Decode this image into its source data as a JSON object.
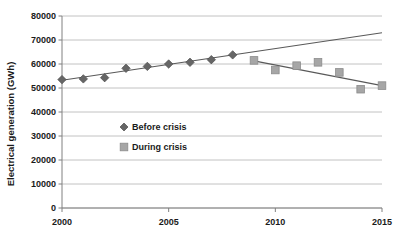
{
  "chart_data": {
    "type": "scatter",
    "title": "",
    "xlabel": "",
    "ylabel": "Electrical generation (GWh)",
    "xlim": [
      2000,
      2015
    ],
    "ylim": [
      0,
      80000
    ],
    "xticks": [
      "2000",
      "2005",
      "2010",
      "2015"
    ],
    "xtick_values": [
      2000,
      2005,
      2010,
      2015
    ],
    "yticks": [
      "0",
      "10000",
      "20000",
      "30000",
      "40000",
      "50000",
      "60000",
      "70000",
      "80000"
    ],
    "ytick_values": [
      0,
      10000,
      20000,
      30000,
      40000,
      50000,
      60000,
      70000,
      80000
    ],
    "grid": "horizontal",
    "legend_position": "center-left-inside",
    "series": [
      {
        "name": "Before crisis",
        "marker": "diamond",
        "color": "#666666",
        "x": [
          2000,
          2001,
          2002,
          2003,
          2004,
          2005,
          2006,
          2007,
          2008
        ],
        "values": [
          53500,
          53800,
          54300,
          58200,
          59000,
          60000,
          60700,
          61800,
          63800
        ]
      },
      {
        "name": "During crisis",
        "marker": "square",
        "color": "#a6a6a6",
        "x": [
          2009,
          2010,
          2011,
          2012,
          2013,
          2014,
          2015
        ],
        "values": [
          61500,
          57500,
          59300,
          60700,
          56500,
          49500,
          51000
        ]
      }
    ],
    "trendlines": [
      {
        "name": "before-crisis-trend",
        "for_series": "Before crisis",
        "x": [
          2000,
          2015
        ],
        "y": [
          53200,
          73000
        ],
        "color": "#595959"
      },
      {
        "name": "during-crisis-trend",
        "for_series": "During crisis",
        "x": [
          2009,
          2015
        ],
        "y": [
          61300,
          51000
        ],
        "color": "#595959"
      }
    ],
    "legend": [
      {
        "label": "Before crisis",
        "marker": "diamond",
        "color": "#666666"
      },
      {
        "label": "During crisis",
        "marker": "square",
        "color": "#a6a6a6"
      }
    ]
  }
}
